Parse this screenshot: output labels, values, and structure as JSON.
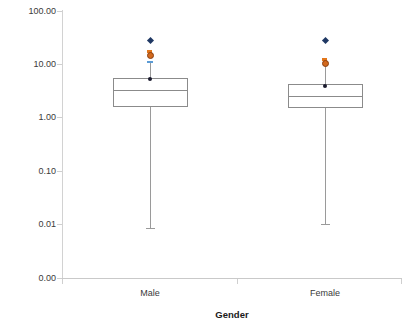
{
  "chart_data": {
    "type": "box",
    "title": "",
    "xlabel": "Gender",
    "ylabel": "µg Cd/kg bodyweight/week",
    "y_scale": "log",
    "ylim": [
      0.0,
      100.0
    ],
    "y_ticks": [
      "100.00",
      "10.00",
      "1.00",
      "0.10",
      "0.01",
      "0.00"
    ],
    "y_tick_values": [
      100.0,
      10.0,
      1.0,
      0.1,
      0.01,
      0.0
    ],
    "grid": false,
    "legend": "none",
    "categories": [
      "Male",
      "Female"
    ],
    "boxes": [
      {
        "category": "Male",
        "whisker_low": 0.0085,
        "q1": 1.55,
        "median": 3.3,
        "q3": 5.5,
        "whisker_high": 11.0,
        "points": [
          {
            "label": "max-outlier",
            "value": 28.0,
            "marker": "diamond",
            "color": "#1f3864"
          },
          {
            "label": "p99",
            "value": 18.0,
            "marker": "dash",
            "color": "#e2761b"
          },
          {
            "label": "p97.5",
            "value": 15.0,
            "marker": "circle",
            "color": "#d2691e"
          },
          {
            "label": "p95",
            "value": 11.0,
            "marker": "dash",
            "color": "#5b9bd5"
          },
          {
            "label": "p90",
            "value": 5.2,
            "marker": "dot",
            "color": "#1a1a2e"
          }
        ]
      },
      {
        "category": "Female",
        "whisker_low": 0.01,
        "q1": 1.5,
        "median": 2.5,
        "q3": 4.2,
        "whisker_high": 9.8,
        "points": [
          {
            "label": "max-outlier",
            "value": 28.0,
            "marker": "diamond",
            "color": "#1f3864"
          },
          {
            "label": "p99",
            "value": 12.5,
            "marker": "dash",
            "color": "#e2761b"
          },
          {
            "label": "p97.5",
            "value": 10.5,
            "marker": "circle",
            "color": "#d2691e"
          },
          {
            "label": "p90",
            "value": 3.9,
            "marker": "dot",
            "color": "#1a1a2e"
          }
        ]
      }
    ]
  },
  "axis": {
    "y_title": "µg Cd/kg bodyweight/week",
    "x_title": "Gender",
    "y_labels": [
      "100.00",
      "10.00",
      "1.00",
      "0.10",
      "0.01",
      "0.00"
    ],
    "x_labels": [
      "Male",
      "Female"
    ]
  },
  "colors": {
    "axis": "#c9c9c9",
    "box_stroke": "#8b8b8b",
    "whisker": "#9a9a9a",
    "diamond": "#1f3864",
    "orange": "#d2691e",
    "orange_dash": "#e2761b",
    "blue_dash": "#5b9bd5",
    "dot": "#1a1a2e",
    "text": "#3a3a3a",
    "title_text": "#1a1a1a",
    "background": "#ffffff"
  }
}
